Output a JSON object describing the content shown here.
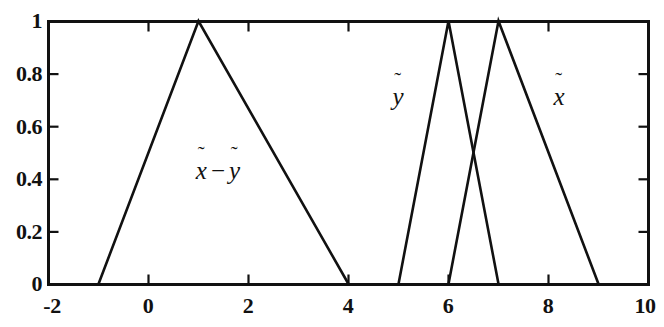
{
  "chart_data": {
    "type": "line",
    "title": "",
    "subtitle": "",
    "xlabel": "",
    "ylabel": "",
    "xlim": [
      -2,
      10
    ],
    "ylim": [
      0,
      1
    ],
    "xticks": [
      -2,
      0,
      2,
      4,
      6,
      8,
      10
    ],
    "xtick_labels": [
      "-2",
      "0",
      "2",
      "4",
      "6",
      "8",
      "10"
    ],
    "yticks": [
      0,
      0.2,
      0.4,
      0.6,
      0.8,
      1
    ],
    "ytick_labels": [
      "0",
      "0.2",
      "0.4",
      "0.6",
      "0.8",
      "1"
    ],
    "grid": false,
    "legend": "none",
    "box": true,
    "ticks_all_sides": true,
    "line_color": "#111111",
    "background_color": "#ffffff",
    "series": [
      {
        "name": "x_tilde_minus_y_tilde",
        "label_parts": {
          "first": "x",
          "operator": "−",
          "second": "y"
        },
        "label_text": "x̃ − ỹ",
        "triangle": [
          -1,
          1,
          4
        ],
        "x": [
          -1,
          1,
          4
        ],
        "values": [
          0,
          1,
          0
        ],
        "label_position": {
          "x": 1.4,
          "y": 0.43
        }
      },
      {
        "name": "y_tilde",
        "label_parts": {
          "first": "y"
        },
        "label_text": "ỹ",
        "triangle": [
          5,
          6,
          7
        ],
        "x": [
          5,
          6,
          7
        ],
        "values": [
          0,
          1,
          0
        ],
        "label_position": {
          "x": 4.98,
          "y": 0.68
        }
      },
      {
        "name": "x_tilde",
        "label_parts": {
          "first": "x"
        },
        "label_text": "x̃",
        "triangle": [
          6,
          7,
          9
        ],
        "x": [
          6,
          7,
          9
        ],
        "values": [
          0,
          1,
          0
        ],
        "label_position": {
          "x": 8.2,
          "y": 0.68
        }
      }
    ],
    "annotations": [
      {
        "name": "intersection",
        "x": 6.5,
        "y": 0.5,
        "label": ""
      }
    ]
  },
  "axes": {
    "x_tick_labels": [
      "-2",
      "0",
      "2",
      "4",
      "6",
      "8",
      "10"
    ],
    "y_tick_labels": [
      "0",
      "0.2",
      "0.4",
      "0.6",
      "0.8",
      "1"
    ]
  }
}
